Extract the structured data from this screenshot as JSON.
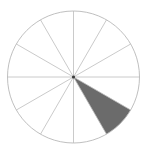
{
  "figure": {
    "title": "Radial sector wheel diagram",
    "canvas_width": 147,
    "canvas_height": 149,
    "background_color": "#ffffff"
  },
  "chart_data": {
    "type": "pie",
    "title": "",
    "subtitle": "",
    "xlabel": "",
    "ylabel": "",
    "legend_position": "none",
    "grid": true,
    "center": {
      "x": 73.5,
      "y": 77.0
    },
    "radius": 66,
    "sector_count": 12,
    "sector_angle_degrees": 30,
    "angle_unit": "degrees",
    "angle_reference": "0 degrees points right (east), angles increase clockwise (screen down)",
    "categories": [
      "sector-1",
      "sector-2",
      "sector-3",
      "sector-4",
      "sector-5",
      "sector-6",
      "sector-7",
      "sector-8",
      "sector-9",
      "sector-10",
      "sector-11",
      "sector-12"
    ],
    "values": [
      30,
      30,
      30,
      30,
      30,
      30,
      30,
      30,
      30,
      30,
      30,
      30
    ],
    "highlighted_index": 1,
    "highlighted_label": "sector-2",
    "highlighted_start_angle": 30,
    "highlighted_end_angle": 60,
    "spoke_angles": [
      0,
      30,
      60,
      90,
      120,
      150,
      180,
      210,
      240,
      270,
      300,
      330
    ],
    "colors": {
      "outline": "#b8b8b8",
      "spoke": "#bcbcbc",
      "highlight_fill": "#6b6b6b",
      "center_dot": "#3a3a3a",
      "background": "#ffffff"
    },
    "stroke_widths": {
      "outline": 0.9,
      "spoke": 0.8
    },
    "center_dot_radius": 1.6
  }
}
